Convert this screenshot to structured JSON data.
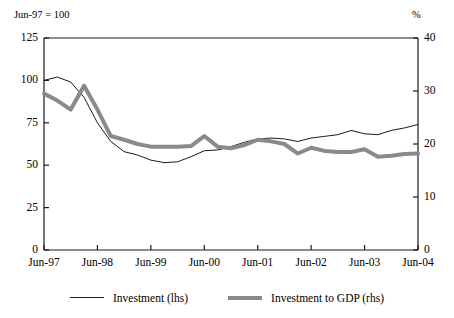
{
  "chart_data": {
    "type": "line",
    "title": "",
    "left_axis_note": "Jun-97 = 100",
    "right_axis_note": "%",
    "xlabel": "",
    "ylabel": "",
    "grid": false,
    "legend_position": "bottom",
    "x": [
      "Jun-97",
      "Sep-97",
      "Dec-97",
      "Mar-98",
      "Jun-98",
      "Sep-98",
      "Dec-98",
      "Mar-99",
      "Jun-99",
      "Sep-99",
      "Dec-99",
      "Mar-00",
      "Jun-00",
      "Sep-00",
      "Dec-00",
      "Mar-01",
      "Jun-01",
      "Sep-01",
      "Dec-01",
      "Mar-02",
      "Jun-02",
      "Sep-02",
      "Dec-02",
      "Mar-03",
      "Jun-03",
      "Sep-03",
      "Dec-03",
      "Mar-04",
      "Jun-04"
    ],
    "xtick_labels": [
      "Jun-97",
      "Jun-98",
      "Jun-99",
      "Jun-00",
      "Jun-01",
      "Jun-02",
      "Jun-03",
      "Jun-04"
    ],
    "xlim": [
      0,
      28
    ],
    "left_ytick_labels": [
      "0",
      "25",
      "50",
      "75",
      "100",
      "125"
    ],
    "left_ytick_values": [
      0,
      25,
      50,
      75,
      100,
      125
    ],
    "left_ylim": [
      0,
      125
    ],
    "right_ytick_labels": [
      "0",
      "10",
      "20",
      "30",
      "40"
    ],
    "right_ytick_values": [
      0,
      10,
      20,
      30,
      40
    ],
    "right_ylim": [
      0,
      40
    ],
    "series": [
      {
        "name": "Investment (lhs)",
        "axis": "left",
        "color": "#1a1a1a",
        "style": "thin-solid",
        "width": 1,
        "values": [
          100,
          102,
          99,
          90,
          75,
          64,
          58,
          56,
          53,
          51.5,
          52,
          55,
          58.5,
          59,
          61,
          63.5,
          65.5,
          66,
          65.5,
          64,
          66,
          67,
          68,
          70.5,
          68.5,
          68,
          70.5,
          72,
          74
        ]
      },
      {
        "name": "Investment to GDP (rhs)",
        "axis": "right",
        "color": "#8a8a8a",
        "style": "thick-solid",
        "width": 4,
        "values": [
          29.5,
          28.2,
          26.5,
          31,
          26.5,
          21.5,
          20.8,
          20,
          19.5,
          19.5,
          19.5,
          19.6,
          21.5,
          19.5,
          19.2,
          19.8,
          20.8,
          20.5,
          20,
          18.2,
          19.3,
          18.7,
          18.5,
          18.5,
          19,
          17.6,
          17.8,
          18.1,
          18.2
        ]
      }
    ]
  },
  "axes": {
    "left_unit": "Jun-97 = 100",
    "right_unit": "%"
  },
  "legend": {
    "items": [
      {
        "label": "Investment (lhs)",
        "swatch": "thin-line-swatch"
      },
      {
        "label": "Investment to GDP (rhs)",
        "swatch": "thick-line-swatch"
      }
    ]
  }
}
